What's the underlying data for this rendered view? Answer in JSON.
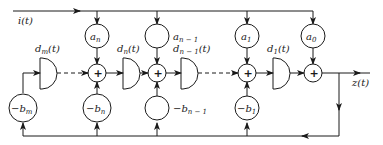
{
  "diagram": {
    "type": "signal-flow",
    "input_label": "i(t)",
    "output_label": "z(t)",
    "adder_symbol": "+",
    "coefficient_nodes": [
      {
        "id": "an",
        "label": "a",
        "sub": "n"
      },
      {
        "id": "an1",
        "label": "a",
        "sub": "n − 1"
      },
      {
        "id": "a1",
        "label": "a",
        "sub": "1"
      },
      {
        "id": "a0",
        "label": "a",
        "sub": "0"
      }
    ],
    "feedback_nodes": [
      {
        "id": "bm",
        "label": "−b",
        "sub": "m"
      },
      {
        "id": "bn",
        "label": "−b",
        "sub": "n"
      },
      {
        "id": "bn1",
        "label": "−b",
        "sub": "n − 1"
      },
      {
        "id": "b1",
        "label": "−b",
        "sub": "1"
      }
    ],
    "delay_elements": [
      {
        "id": "dm",
        "label": "d",
        "sub": "m",
        "suffix": "(t)"
      },
      {
        "id": "dn",
        "label": "d",
        "sub": "n",
        "suffix": "(t)"
      },
      {
        "id": "dn1",
        "label": "d",
        "sub": "n − 1",
        "suffix": "(t)"
      },
      {
        "id": "d1",
        "label": "d",
        "sub": "1",
        "suffix": "(t)"
      }
    ]
  }
}
